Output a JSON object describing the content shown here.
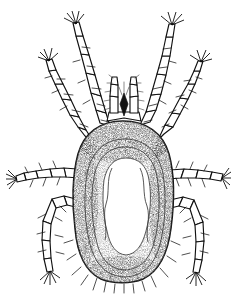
{
  "figure": {
    "domain": "natural-image-line-drawing",
    "view": "dorsal",
    "style": "stippled scientific ink illustration",
    "background_color": "#ffffff",
    "ink_color": "#111111",
    "stipple_color": "#4a4a4a",
    "canvas": {
      "width": 231,
      "height": 294
    }
  },
  "anatomy": {
    "idiosoma": {
      "label": "idiosoma",
      "shape": "ovoid",
      "bounds": {
        "x": 74,
        "y": 121,
        "width": 99,
        "height": 162
      },
      "shading": "dense stipple, darkest along anterior margin and lateral rims",
      "margin_setae_count": 14
    },
    "scutum": {
      "label": "pale inner field",
      "description": "irregular unstippled pale region occupying central dorsum",
      "outline_passes": 3
    },
    "capitulum": {
      "label": "capitulum",
      "position": {
        "x": 100,
        "y": 76,
        "width": 30,
        "height": 48
      },
      "parts": [
        "palp-left",
        "palp-right",
        "hypostome"
      ]
    },
    "legs": [
      {
        "id": "leg-1-left",
        "name": "leg I left",
        "side": "left",
        "pair": 1,
        "segments": 6,
        "direction": "anterodorsal"
      },
      {
        "id": "leg-1-right",
        "name": "leg I right",
        "side": "right",
        "pair": 1,
        "segments": 6,
        "direction": "anterodorsal"
      },
      {
        "id": "leg-2-left",
        "name": "leg II left",
        "side": "left",
        "pair": 2,
        "segments": 6,
        "direction": "anterolateral"
      },
      {
        "id": "leg-2-right",
        "name": "leg II right",
        "side": "right",
        "pair": 2,
        "segments": 6,
        "direction": "anterolateral"
      },
      {
        "id": "leg-3-left",
        "name": "leg III left",
        "side": "left",
        "pair": 3,
        "segments": 6,
        "direction": "lateral"
      },
      {
        "id": "leg-3-right",
        "name": "leg III right",
        "side": "right",
        "pair": 3,
        "segments": 6,
        "direction": "lateral"
      },
      {
        "id": "leg-4-left",
        "name": "leg IV left",
        "side": "left",
        "pair": 4,
        "segments": 6,
        "direction": "posterolateral"
      },
      {
        "id": "leg-4-right",
        "name": "leg IV right",
        "side": "right",
        "pair": 4,
        "segments": 6,
        "direction": "posterolateral"
      }
    ],
    "leg_count": 8
  },
  "labels": {
    "none_visible": "",
    "caption": ""
  }
}
